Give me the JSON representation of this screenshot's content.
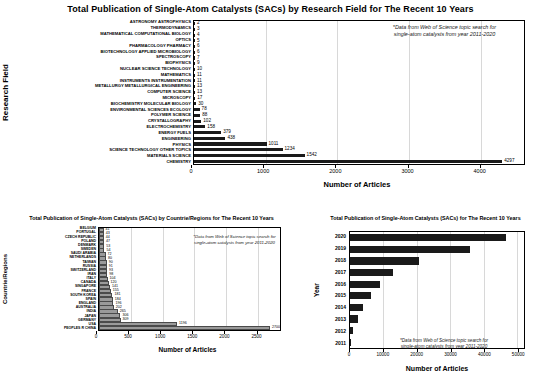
{
  "chart_data": [
    {
      "id": "research-field",
      "type": "bar",
      "orientation": "horizontal",
      "title": "Total Publication of Single-Atom Catalysts (SACs) by Research Field for The Recent 10 Years",
      "xlabel": "Number of Articles",
      "ylabel": "Research Field",
      "xlim": [
        0,
        4600
      ],
      "xticks": [
        0,
        1000,
        2000,
        3000,
        4000
      ],
      "xticklabels": [
        "0",
        "1000",
        "2000",
        "3000",
        "4000"
      ],
      "grid": true,
      "bar_color": "#1a1a1a",
      "annotation": "*Data from Web of Science topic search for\nsingle-atom catalysts from year 2011-2020",
      "categories": [
        "ASTRONOMY ASTROPHYSICS",
        "THERMODYNAMICS",
        "MATHEMATICAL COMPUTATIONAL BIOLOGY",
        "OPTICS",
        "PHARMACOLOGY PHARMACY",
        "BIOTECHNOLOGY APPLIED MICROBIOLOGY",
        "SPECTROSCOPY",
        "BIOPHYSICS",
        "NUCLEAR SCIENCE TECHNOLOGY",
        "MATHEMATICS",
        "INSTRUMENTS INSTRUMENTATION",
        "METALLURGY METALLURGICAL ENGINEERING",
        "COMPUTER SCIENCE",
        "MICROSCOPY",
        "BIOCHEMISTRY MOLECULAR BIOLOGY",
        "ENVIRONMENTAL SCIENCES ECOLOGY",
        "POLYMER SCIENCE",
        "CRYSTALLOGRAPHY",
        "ELECTROCHEMISTRY",
        "ENERGY FUELS",
        "ENGINEERING",
        "PHYSICS",
        "SCIENCE TECHNOLOGY OTHER TOPICS",
        "MATERIALS SCIENCE",
        "CHEMISTRY"
      ],
      "values": [
        2,
        3,
        4,
        5,
        6,
        6,
        7,
        9,
        10,
        11,
        11,
        13,
        13,
        17,
        30,
        78,
        88,
        102,
        158,
        379,
        438,
        1011,
        1234,
        1542,
        4297
      ],
      "labels": [
        "2",
        "3",
        "4",
        "5",
        "6",
        "6",
        "7",
        "9",
        "10",
        "11",
        "11",
        "13",
        "13",
        "17",
        "30",
        "78",
        "88",
        "102",
        "158",
        "379",
        "438",
        "1011",
        "1234",
        "1542",
        "4297"
      ]
    },
    {
      "id": "countries-regions",
      "type": "bar",
      "orientation": "horizontal",
      "title": "Total Publication of Single-Atom Catalysts (SACs) by Countrie/Regions for The Recent 10 Years",
      "xlabel": "Number of Articles",
      "ylabel": "Countrie/Regions",
      "xlim": [
        0,
        2850
      ],
      "xticks": [
        0,
        500,
        1000,
        1500,
        2000,
        2500
      ],
      "xticklabels": [
        "0",
        "500",
        "1000",
        "1500",
        "2000",
        "2500"
      ],
      "grid": true,
      "bar_color": "#9a9a9a",
      "annotation": "*Data from Web of Science topic search for\nsingle-atom catalysts from year 2011-2020",
      "categories": [
        "BELGIUM",
        "PORTUGAL",
        "CZECH REPUBLIC",
        "POLAND",
        "DENMARK",
        "SWEDEN",
        "SAUDI ARABIA",
        "NETHERLANDS",
        "TAIWAN",
        "RUSSIA",
        "SWITZERLAND",
        "IRAN",
        "ITALY",
        "CANADA",
        "SINGAPORE",
        "FRANCE",
        "SOUTH KOREA",
        "SPAIN",
        "ENGLAND",
        "AUSTRALIA",
        "INDIA",
        "JAPAN",
        "GERMANY",
        "USA",
        "PEOPLES R CHINA"
      ],
      "values": [
        41,
        43,
        44,
        47,
        53,
        54,
        72,
        80,
        90,
        91,
        93,
        98,
        104,
        120,
        141,
        155,
        181,
        184,
        196,
        202,
        265,
        306,
        309,
        1196,
        2700
      ],
      "labels": [
        "41",
        "43",
        "44",
        "47",
        "53",
        "54",
        "72",
        "80",
        "90",
        "91",
        "93",
        "98",
        "104",
        "120",
        "141",
        "155",
        "181",
        "184",
        "196",
        "202",
        "265",
        "306",
        "309",
        "1196",
        "2700"
      ]
    },
    {
      "id": "by-year",
      "type": "bar",
      "orientation": "horizontal",
      "title": "Total Publication of Single-Atom Catalysts (SACs) for The Recent 10 Years",
      "xlabel": "Number of Articles",
      "ylabel": "Year",
      "xlim": [
        0,
        52000
      ],
      "xticks": [
        0,
        10000,
        20000,
        30000,
        40000,
        50000
      ],
      "xticklabels": [
        "0",
        "10000",
        "20000",
        "30000",
        "40000",
        "50000"
      ],
      "grid": true,
      "bar_color": "#1a1a1a",
      "annotation": "*Data from Web of Science topic search for\nsingle-atom catalysts from year 2011-2020",
      "categories": [
        "2020",
        "2019",
        "2018",
        "2017",
        "2016",
        "2015",
        "2014",
        "2013",
        "2012",
        "2011"
      ],
      "values": [
        46500,
        36000,
        20500,
        12800,
        9000,
        6400,
        4000,
        2300,
        900,
        300
      ],
      "labels": [
        "",
        "",
        "",
        "",
        "",
        "",
        "",
        "",
        "",
        ""
      ]
    }
  ]
}
